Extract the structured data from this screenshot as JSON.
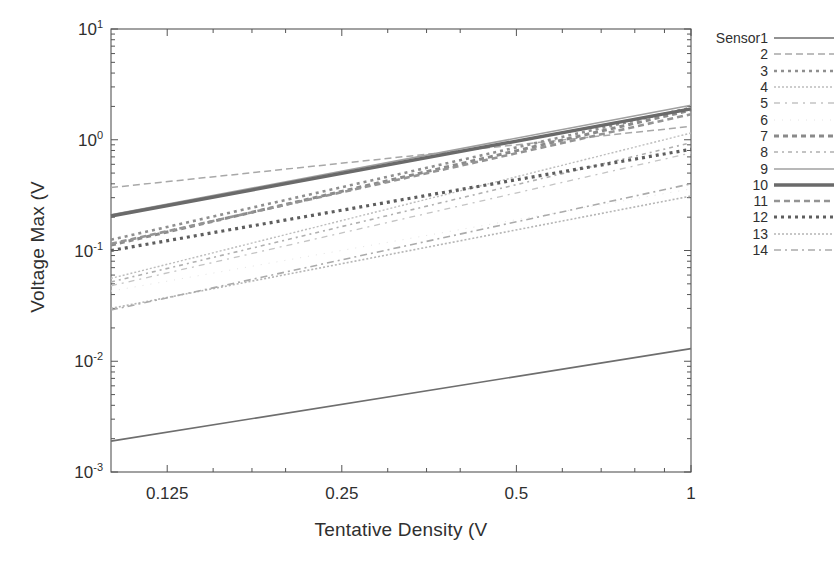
{
  "figure": {
    "background": "#ffffff",
    "frame_color": "#555555",
    "width": 835,
    "height": 561
  },
  "axes": {
    "x": {
      "label": "Tentative Density (V",
      "scale": "log",
      "min": 0.1,
      "max": 1.0,
      "ticks": [
        0.125,
        0.25,
        0.5,
        1
      ],
      "tick_labels": [
        "0.125",
        "0.25",
        "0.5",
        "1"
      ]
    },
    "y": {
      "label": "Voltage Max (V",
      "scale": "log",
      "min": 0.001,
      "max": 10,
      "ticks": [
        0.001,
        0.01,
        0.1,
        1,
        10
      ],
      "tick_labels": [
        "10-3",
        "10-2",
        "10-1",
        "100",
        "101"
      ],
      "tick_mantissa": "10",
      "tick_exponents": [
        "-3",
        "-2",
        "-1",
        "0",
        "1"
      ]
    }
  },
  "legend": {
    "position": "right",
    "entries": [
      {
        "label": "Sensor1",
        "dash": "none",
        "color": "#6e6e6e",
        "width": 1.6
      },
      {
        "label": "2",
        "dash": "7,4",
        "color": "#a8a8a8",
        "width": 1.5
      },
      {
        "label": "3",
        "dash": "3,4",
        "color": "#8f8f8f",
        "width": 2.6
      },
      {
        "label": "4",
        "dash": "2,2",
        "color": "#bdbdbd",
        "width": 1.4
      },
      {
        "label": "5",
        "dash": "6,5,2,5",
        "color": "#c4c4c4",
        "width": 1.3
      },
      {
        "label": "6",
        "dash": "1,7",
        "color": "#e4e4e4",
        "width": 1.0
      },
      {
        "label": "7",
        "dash": "5,4",
        "color": "#8a8a8a",
        "width": 3.0
      },
      {
        "label": "8",
        "dash": "4,4,2,4",
        "color": "#b0b0b0",
        "width": 1.6
      },
      {
        "label": "9",
        "dash": "none",
        "color": "#a0a0a0",
        "width": 1.6
      },
      {
        "label": "10",
        "dash": "none",
        "color": "#6a6a6a",
        "width": 3.4
      },
      {
        "label": "11",
        "dash": "6,4",
        "color": "#949494",
        "width": 2.6
      },
      {
        "label": "12",
        "dash": "3,4",
        "color": "#5e5e5e",
        "width": 3.2
      },
      {
        "label": "13",
        "dash": "2,2",
        "color": "#b5b5b5",
        "width": 1.6
      },
      {
        "label": "14",
        "dash": "7,4,2,4",
        "color": "#ababab",
        "width": 1.6
      }
    ]
  },
  "chart_data": {
    "type": "line",
    "title": "",
    "xlabel": "Tentative Density (V",
    "ylabel": "Voltage Max (V",
    "xscale": "log",
    "yscale": "log",
    "xlim": [
      0.1,
      1.0
    ],
    "ylim": [
      0.001,
      10
    ],
    "grid": false,
    "legend_position": "right",
    "x": [
      0.1,
      1.0
    ],
    "series": [
      {
        "name": "Sensor1",
        "values": [
          0.0019,
          0.013
        ]
      },
      {
        "name": "2",
        "values": [
          0.37,
          1.32
        ]
      },
      {
        "name": "3",
        "values": [
          0.125,
          1.95
        ]
      },
      {
        "name": "4",
        "values": [
          0.056,
          1.15
        ]
      },
      {
        "name": "5",
        "values": [
          0.048,
          0.76
        ]
      },
      {
        "name": "6",
        "values": [
          0.043,
          0.36
        ]
      },
      {
        "name": "7",
        "values": [
          0.112,
          1.85
        ]
      },
      {
        "name": "8",
        "values": [
          0.052,
          0.94
        ]
      },
      {
        "name": "9",
        "values": [
          0.21,
          2.05
        ]
      },
      {
        "name": "10",
        "values": [
          0.205,
          1.9
        ]
      },
      {
        "name": "11",
        "values": [
          0.115,
          1.7
        ]
      },
      {
        "name": "12",
        "values": [
          0.1,
          0.82
        ]
      },
      {
        "name": "13",
        "values": [
          0.03,
          0.31
        ]
      },
      {
        "name": "14",
        "values": [
          0.029,
          0.4
        ]
      }
    ]
  }
}
